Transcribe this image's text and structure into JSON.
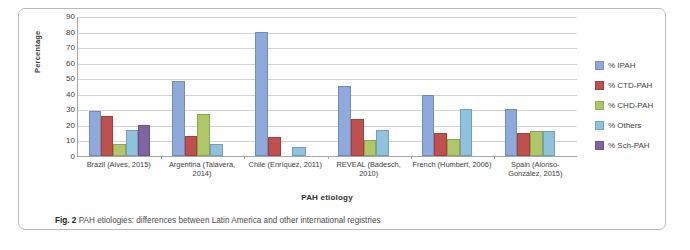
{
  "figure": {
    "caption_prefix": "Fig. 2",
    "caption_text": "PAH etiologies: differences between Latin America and other international registries"
  },
  "chart_data": {
    "type": "bar",
    "title": "",
    "xlabel": "PAH etiology",
    "ylabel": "Percentage",
    "ylim": [
      0,
      90
    ],
    "yticks": [
      90,
      80,
      70,
      60,
      50,
      40,
      30,
      20,
      10,
      0
    ],
    "grid": true,
    "legend_position": "right",
    "categories": [
      "Brazil (Alves, 2015)",
      "Argentina (Talavera, 2014)",
      "Chile (Enríquez, 2011)",
      "REVEAL (Badesch, 2010)",
      "French (Humbert, 2006)",
      "Spain (Alonso-Gonzalez, 2015)"
    ],
    "series": [
      {
        "name": "% IPAH",
        "color": "#8ea9db",
        "values": [
          29,
          48,
          80,
          45,
          39,
          30
        ]
      },
      {
        "name": "% CTD-PAH",
        "color": "#c0504d",
        "values": [
          26,
          13,
          12,
          24,
          15,
          15
        ]
      },
      {
        "name": "% CHD-PAH",
        "color": "#aec769",
        "values": [
          8,
          27,
          null,
          10,
          11,
          16
        ]
      },
      {
        "name": "% Others",
        "color": "#8fc2dd",
        "values": [
          17,
          8,
          6,
          17,
          30,
          16
        ]
      },
      {
        "name": "% Sch-PAH",
        "color": "#8064a2",
        "values": [
          20,
          null,
          null,
          null,
          null,
          null
        ]
      }
    ]
  }
}
